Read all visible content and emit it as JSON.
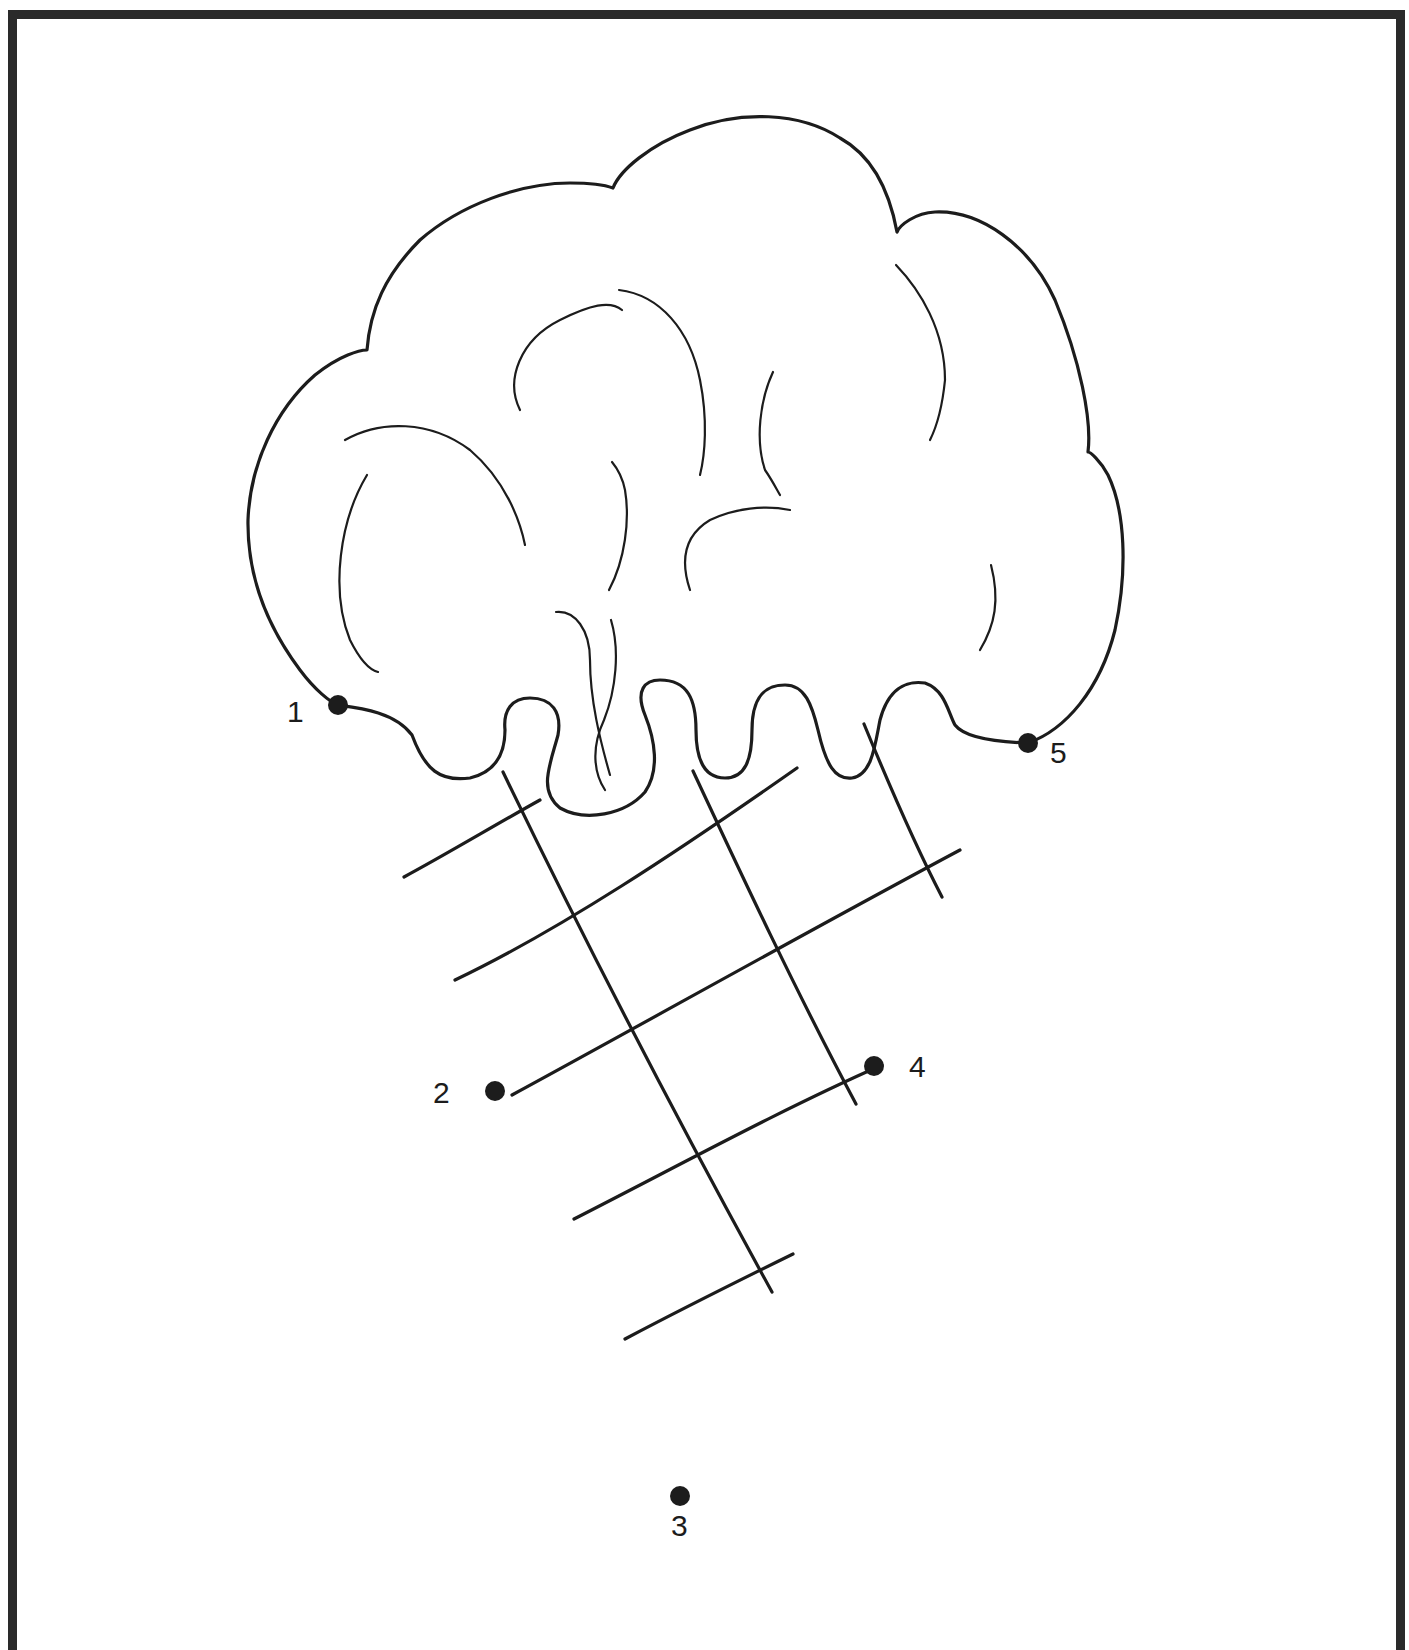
{
  "worksheet": {
    "type": "connect-the-dots",
    "subject": "ice cream cone",
    "ink_color": "#1c1c1c",
    "frame_color": "#2a2a2a",
    "dots": [
      {
        "number": "1",
        "label": "1",
        "x": 338,
        "y": 705
      },
      {
        "number": "2",
        "label": "2",
        "x": 495,
        "y": 1091
      },
      {
        "number": "3",
        "label": "3",
        "x": 680,
        "y": 1496
      },
      {
        "number": "4",
        "label": "4",
        "x": 874,
        "y": 1066
      },
      {
        "number": "5",
        "label": "5",
        "x": 1028,
        "y": 743
      }
    ]
  }
}
